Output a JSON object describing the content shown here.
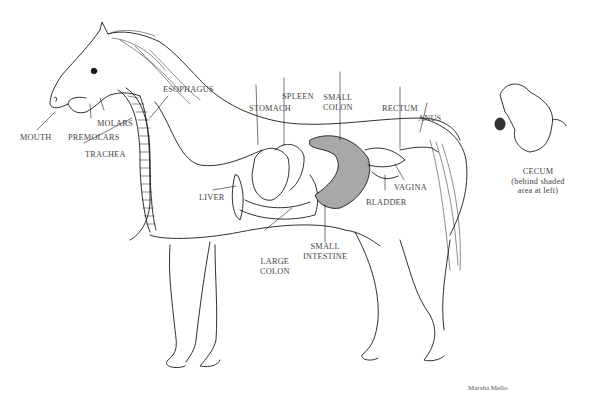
{
  "diagram": {
    "labels": {
      "mouth": "MOUTH",
      "premolars": "PREMOLARS",
      "molars": "MOLARS",
      "trachea": "TRACHEA",
      "esophagus": "ESOPHAGUS",
      "stomach": "STOMACH",
      "spleen": "SPLEEN",
      "small_colon_1": "SMALL",
      "small_colon_2": "COLON",
      "rectum": "RECTUM",
      "anus": "ANUS",
      "vagina": "VAGINA",
      "bladder": "BLADDER",
      "liver": "LIVER",
      "large_colon_1": "LARGE",
      "large_colon_2": "COLON",
      "small_intestine_1": "SMALL",
      "small_intestine_2": "INTESTINE"
    },
    "inset": {
      "title": "CECUM",
      "note_1": "(behind shaded",
      "note_2": "area  at left)"
    },
    "credit": "Marsha Mello",
    "colors": {
      "line": "#1a1a1a",
      "shaded": "#a8a8a8",
      "text": "#444444",
      "background": "#ffffff"
    }
  }
}
